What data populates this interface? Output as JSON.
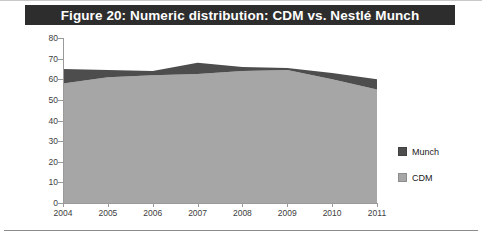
{
  "figure": {
    "title": "Figure 20: Numeric distribution: CDM vs. Nestlé Munch",
    "title_bar_color": "#2d2d2d",
    "title_text_color": "#ffffff"
  },
  "legend": {
    "position": "right",
    "items": [
      {
        "label": "Munch",
        "color": "#4d4d4d"
      },
      {
        "label": "CDM",
        "color": "#a6a6a6"
      }
    ]
  },
  "axes": {
    "y_ticks": [
      "80",
      "70",
      "60",
      "50",
      "40",
      "30",
      "20",
      "10",
      "0"
    ],
    "x_ticks": [
      "2004",
      "2005",
      "2006",
      "2007",
      "2008",
      "2009",
      "2010",
      "2011"
    ]
  },
  "chart_data": {
    "type": "area",
    "stacked": true,
    "title": "Figure 20: Numeric distribution: CDM vs. Nestlé Munch",
    "xlabel": "",
    "ylabel": "",
    "categories": [
      "2004",
      "2005",
      "2006",
      "2007",
      "2008",
      "2009",
      "2010",
      "2011"
    ],
    "ylim": [
      0,
      80
    ],
    "ytick_step": 10,
    "grid": false,
    "legend_position": "right",
    "series": [
      {
        "name": "CDM",
        "color": "#a6a6a6",
        "values": [
          58,
          61,
          62,
          62.5,
          64,
          64.5,
          60,
          55
        ]
      },
      {
        "name": "Munch",
        "color": "#4d4d4d",
        "values": [
          7,
          3.5,
          2,
          5.5,
          2,
          1,
          3,
          5
        ]
      }
    ],
    "cumulative_top": [
      65,
      64.5,
      64,
      68,
      66,
      65.5,
      63,
      60
    ]
  }
}
